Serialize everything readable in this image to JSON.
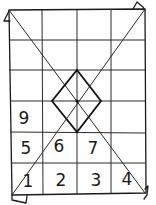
{
  "diagram": {
    "type": "grid-with-diagonals",
    "grid": {
      "columns": 4,
      "rows": 6
    },
    "stroke_color": "#1a1a1a",
    "background": "#ffffff",
    "cells": [
      {
        "label": "9",
        "row": 4,
        "col": 1
      },
      {
        "label": "5",
        "row": 5,
        "col": 1
      },
      {
        "label": "6",
        "row": 5,
        "col": 2
      },
      {
        "label": "7",
        "row": 5,
        "col": 3
      },
      {
        "label": "1",
        "row": 6,
        "col": 1
      },
      {
        "label": "2",
        "row": 6,
        "col": 2
      },
      {
        "label": "3",
        "row": 6,
        "col": 3
      },
      {
        "label": "4",
        "row": 6,
        "col": 4
      }
    ],
    "features": [
      "two corner-to-corner diagonals",
      "center diamond",
      "folded corner flaps"
    ]
  }
}
